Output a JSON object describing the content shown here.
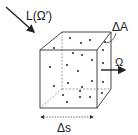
{
  "diagram": {
    "type": "volume-element-radiance",
    "labels": {
      "incoming_radiance": "L(Ω′)",
      "area": "ΔA",
      "direction": "Ω",
      "path_length": "Δs"
    },
    "colors": {
      "line": "#333333",
      "dashed": "#666666",
      "particle": "#222222",
      "background": "#ffffff"
    },
    "particles": [
      [
        54,
        48
      ],
      [
        70,
        38
      ],
      [
        81,
        43
      ],
      [
        90,
        40
      ],
      [
        105,
        42
      ],
      [
        73,
        53
      ],
      [
        82,
        55
      ],
      [
        50,
        67
      ],
      [
        67,
        65
      ],
      [
        92,
        60
      ],
      [
        78,
        71
      ],
      [
        103,
        63
      ],
      [
        103,
        50
      ],
      [
        68,
        83
      ],
      [
        54,
        86
      ],
      [
        92,
        81
      ],
      [
        82,
        87
      ],
      [
        103,
        82
      ],
      [
        63,
        95
      ],
      [
        80,
        97
      ],
      [
        90,
        97
      ],
      [
        67,
        102
      ],
      [
        80,
        91
      ],
      [
        102,
        93
      ]
    ]
  }
}
